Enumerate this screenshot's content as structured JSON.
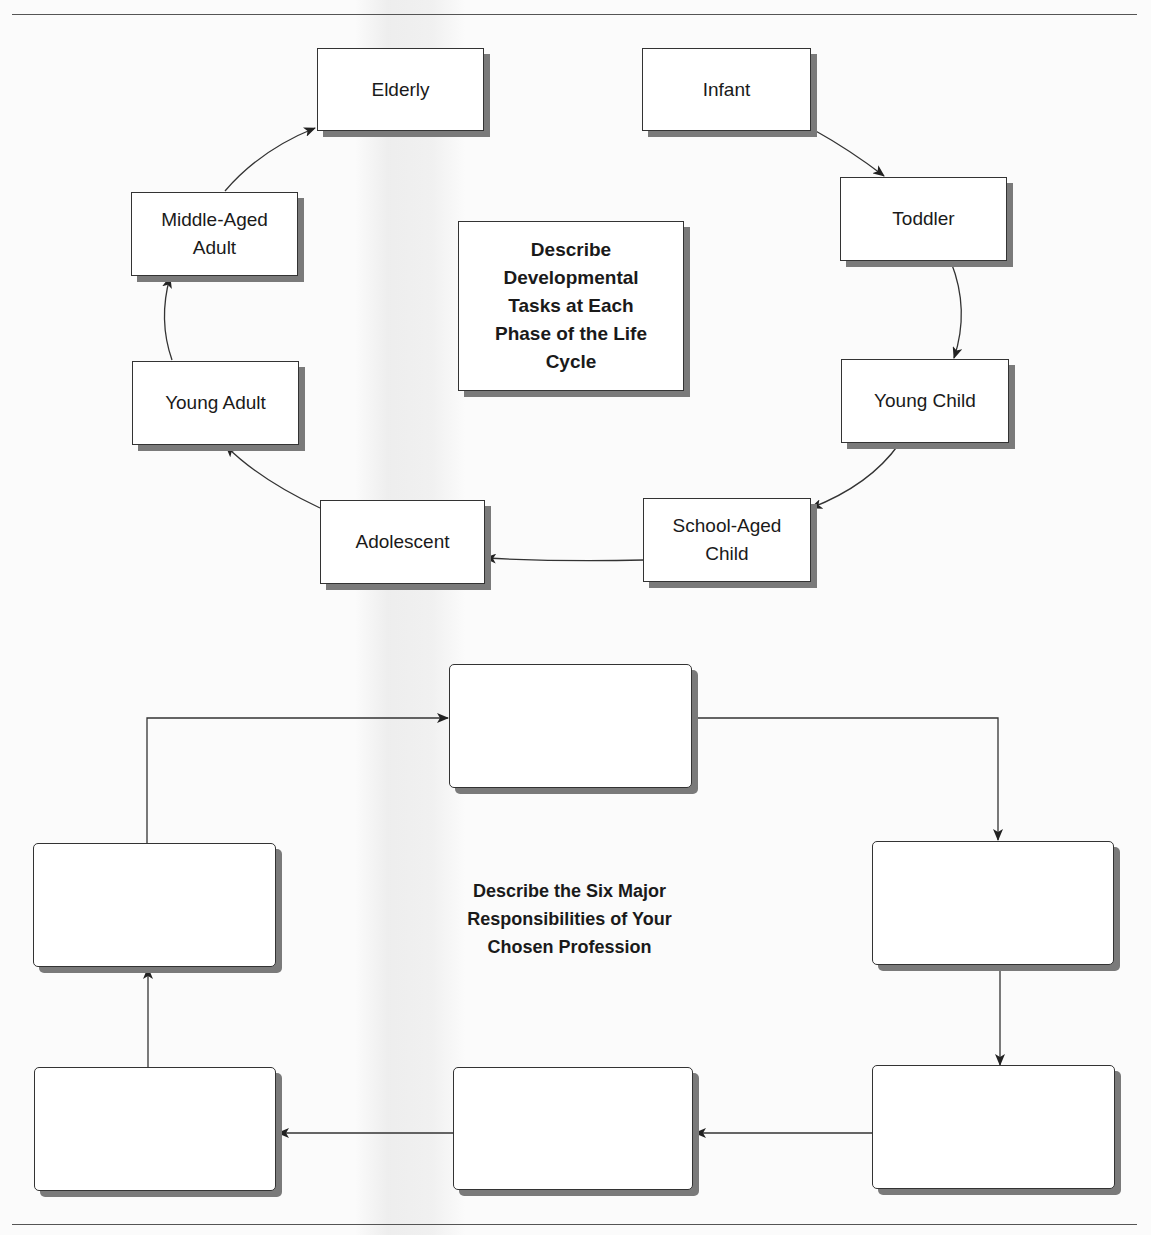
{
  "figure": {
    "top_text_cropped": ""
  },
  "life_cycle": {
    "title": "Describe\nDevelopmental\nTasks at Each\nPhase of the Life\nCycle",
    "stages": [
      {
        "id": "infant",
        "label": "Infant"
      },
      {
        "id": "toddler",
        "label": "Toddler"
      },
      {
        "id": "young-child",
        "label": "Young Child"
      },
      {
        "id": "school-aged-child",
        "label": "School-Aged\nChild"
      },
      {
        "id": "adolescent",
        "label": "Adolescent"
      },
      {
        "id": "young-adult",
        "label": "Young Adult"
      },
      {
        "id": "middle-aged-adult",
        "label": "Middle-Aged\nAdult"
      },
      {
        "id": "elderly",
        "label": "Elderly"
      }
    ]
  },
  "responsibilities": {
    "title": "Describe the Six Major\nResponsibilities of Your\nChosen Profession",
    "boxes": [
      {
        "id": "resp-1",
        "label": ""
      },
      {
        "id": "resp-2",
        "label": ""
      },
      {
        "id": "resp-3",
        "label": ""
      },
      {
        "id": "resp-4",
        "label": ""
      },
      {
        "id": "resp-5",
        "label": ""
      },
      {
        "id": "resp-6",
        "label": ""
      }
    ]
  }
}
